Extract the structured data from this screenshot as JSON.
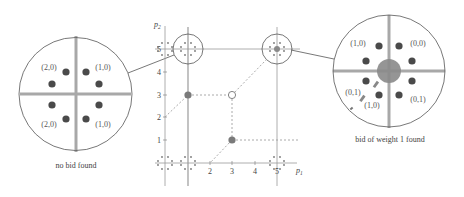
{
  "colors": {
    "line": "#9a9a9a",
    "dark": "#555555",
    "dot": "#4a4a4a",
    "cross": "#a8a8a8",
    "center_disk": "#8a8a8a",
    "dash": "#a0a0a0"
  },
  "plot": {
    "origin_x": 165,
    "origin_y": 163,
    "unit": 22.6,
    "x_axis_label": "p",
    "x_axis_sub": "1",
    "y_axis_label": "p",
    "y_axis_sub": "2",
    "x_ticks": [
      "2",
      "3",
      "4",
      "5"
    ],
    "y_ticks": [
      "1",
      "2",
      "3",
      "4",
      "5"
    ],
    "points": [
      {
        "p1": 1,
        "p2": 3,
        "type": "filled"
      },
      {
        "p1": 3,
        "p2": 3,
        "type": "open"
      },
      {
        "p1": 3,
        "p2": 1,
        "type": "filled"
      }
    ]
  },
  "left_zoom": {
    "caption": "no bid found",
    "labels": [
      "(2,0)",
      "(1,0)",
      "(2,0)",
      "(1,0)"
    ]
  },
  "right_zoom": {
    "caption": "bid of weight 1 found",
    "labels": [
      "(1,0)",
      "(0,0)",
      "(0,1)",
      "(1,0)",
      "(0,1)"
    ]
  }
}
